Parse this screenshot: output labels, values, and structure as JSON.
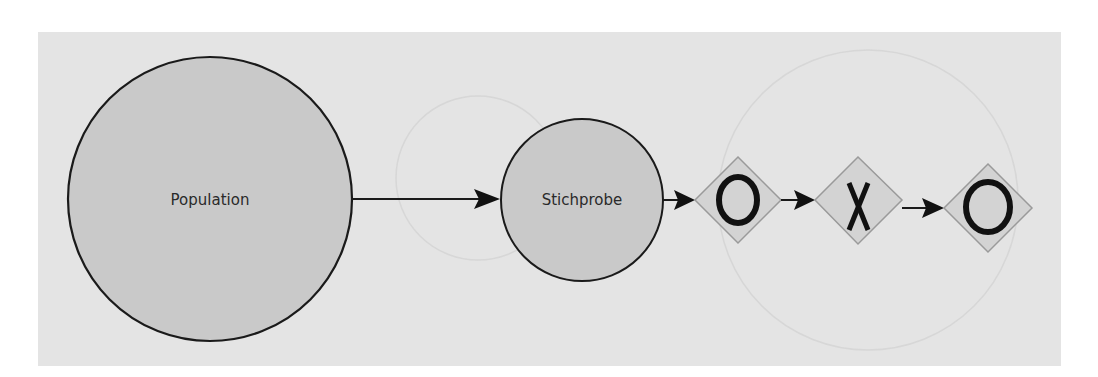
{
  "diagram": {
    "background_color": "#e4e4e4",
    "nodes": [
      {
        "id": "population",
        "shape": "circle",
        "label": "Population",
        "fill": "#c9c9c9",
        "stroke": "#1a1a1a"
      },
      {
        "id": "stichprobe",
        "shape": "circle",
        "label": "Stichprobe",
        "fill": "#c9c9c9",
        "stroke": "#1a1a1a"
      },
      {
        "id": "outcome-1",
        "shape": "diamond",
        "symbol": "O",
        "symbol_meaning": "circle-mark",
        "stroke": "#9a9a9a"
      },
      {
        "id": "outcome-2",
        "shape": "diamond",
        "symbol": "X",
        "symbol_meaning": "cross-mark",
        "stroke": "#9a9a9a"
      },
      {
        "id": "outcome-3",
        "shape": "diamond",
        "symbol": "O",
        "symbol_meaning": "circle-mark",
        "stroke": "#9a9a9a"
      }
    ],
    "edges": [
      {
        "from": "population",
        "to": "stichprobe"
      },
      {
        "from": "stichprobe",
        "to": "outcome-1"
      },
      {
        "from": "outcome-1",
        "to": "outcome-2"
      },
      {
        "from": "outcome-2",
        "to": "outcome-3"
      }
    ]
  }
}
